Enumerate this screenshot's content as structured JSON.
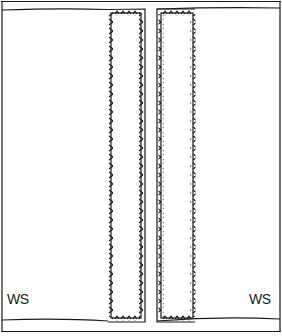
{
  "diagram": {
    "labels": {
      "left": "WS",
      "right": "WS"
    },
    "colors": {
      "stroke": "#1a1a1a",
      "background": "#ffffff"
    },
    "elements": [
      {
        "name": "fabric-panel",
        "description": "large fabric piece with top and bottom edges"
      },
      {
        "name": "left-strip",
        "description": "vertical strip with whipstitched edges"
      },
      {
        "name": "right-strip",
        "description": "vertical strip with whipstitched edges"
      }
    ]
  }
}
